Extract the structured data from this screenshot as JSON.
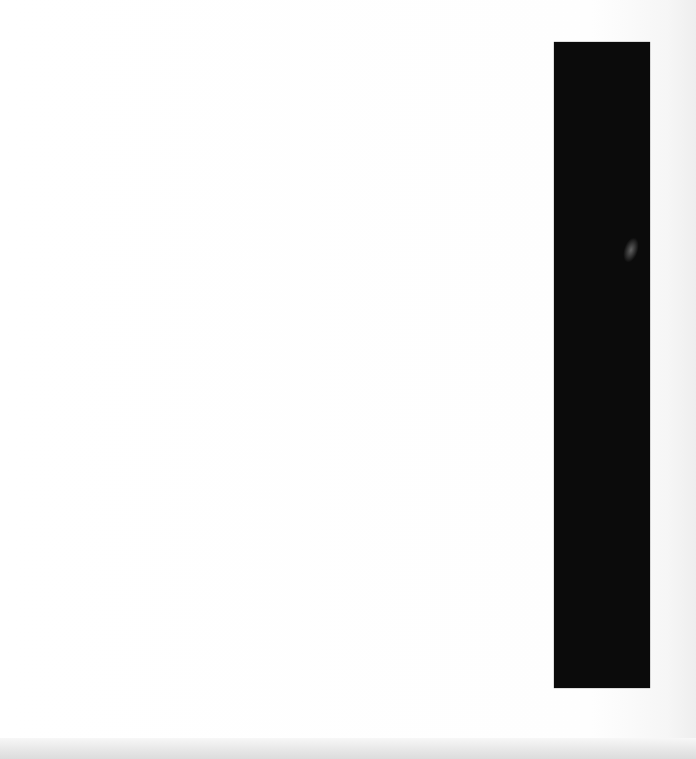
{
  "document": {
    "type": "scanned-page",
    "text_content": "",
    "redaction": {
      "color": "#0b0b0b",
      "position": "right"
    },
    "background_color": "#fdfdfd"
  }
}
